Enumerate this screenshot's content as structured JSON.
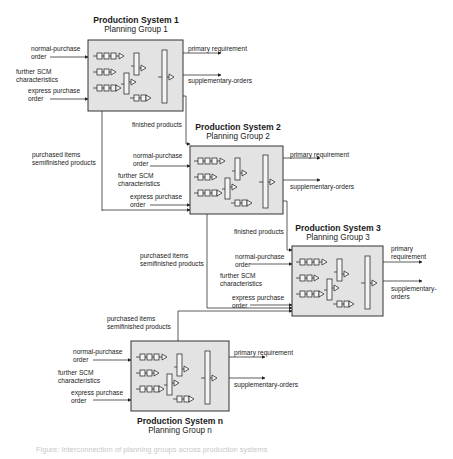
{
  "colors": {
    "box_fill": "#e3e3e3",
    "stroke": "#333333",
    "background": "#ffffff"
  },
  "systems": [
    {
      "id": "ps1",
      "title": "Production System 1",
      "group": "Planning Group 1",
      "inputs": {
        "normal": "normal-purchase order",
        "normal_l1": "normal-purchase",
        "normal_l2": "order",
        "further_l1": "further SCM",
        "further_l2": "characteristics",
        "express_l1": "express purchase",
        "express_l2": "order"
      },
      "outputs": {
        "primary": "primary requirement",
        "supplementary": "supplementary-orders"
      }
    },
    {
      "id": "ps2",
      "title": "Production System 2",
      "group": "Planning Group 2",
      "inputs": {
        "normal_l1": "normal-purchase",
        "normal_l2": "order",
        "further_l1": "further SCM",
        "further_l2": "characteristics",
        "express_l1": "express purchase",
        "express_l2": "order"
      },
      "outputs": {
        "primary": "primary requirement",
        "supplementary": "supplementary-orders"
      }
    },
    {
      "id": "ps3",
      "title": "Production System 3",
      "group": "Planning Group 3",
      "inputs": {
        "normal_l1": "normal-purchase",
        "normal_l2": "order",
        "further_l1": "further SCM",
        "further_l2": "characteristics",
        "express_l1": "express purchase",
        "express_l2": "order"
      },
      "outputs": {
        "primary_l1": "primary",
        "primary_l2": "requirement",
        "supplementary_l1": "supplementary-",
        "supplementary_l2": "orders"
      }
    },
    {
      "id": "psn",
      "title": "Production System n",
      "group": "Planning Group n",
      "inputs": {
        "normal_l1": "normal-purchase",
        "normal_l2": "order",
        "further_l1": "further SCM",
        "further_l2": "characteristics",
        "express_l1": "express purchase",
        "express_l2": "order"
      },
      "outputs": {
        "primary": "primary requirement",
        "supplementary": "supplementary-orders"
      }
    }
  ],
  "flows": {
    "finished_products_1": "finished products",
    "finished_products_2": "finished products",
    "purchased_1_l1": "purchased items",
    "purchased_1_l2": "semifinished products",
    "purchased_2_l1": "purchased items",
    "purchased_2_l2": "semifinished products",
    "purchased_3_l1": "purchased items",
    "purchased_3_l2": "semifinished products"
  },
  "caption": "Figure: Interconnection of planning groups across production systems"
}
